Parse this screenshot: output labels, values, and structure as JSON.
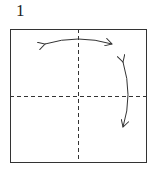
{
  "diagram": {
    "step_number": "1",
    "paper": {
      "x": 10,
      "y": 29,
      "width": 136,
      "height": 133,
      "stroke": "#333333"
    },
    "creases": [
      {
        "type": "valley-fold-dashed",
        "orientation": "vertical",
        "label": "vertical center crease"
      },
      {
        "type": "valley-fold-dashed",
        "orientation": "horizontal",
        "label": "horizontal center crease"
      }
    ],
    "arrows": [
      {
        "type": "fold-unfold",
        "orientation": "horizontal",
        "position": "top"
      },
      {
        "type": "fold-unfold",
        "orientation": "vertical",
        "position": "right"
      }
    ]
  }
}
